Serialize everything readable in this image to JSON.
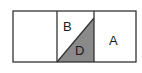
{
  "diagram": {
    "type": "rectangle divided into three cells, middle cell split diagonally",
    "cells": [
      {
        "id": "left",
        "label": ""
      },
      {
        "id": "middle-upper",
        "label": "B",
        "fill": "#ffffff"
      },
      {
        "id": "middle-lower",
        "label": "D",
        "fill": "#8a8a8a"
      },
      {
        "id": "right",
        "label": "A"
      }
    ],
    "colors": {
      "stroke": "#333333",
      "shaded": "#8a8a8a",
      "background": "#ffffff"
    }
  }
}
